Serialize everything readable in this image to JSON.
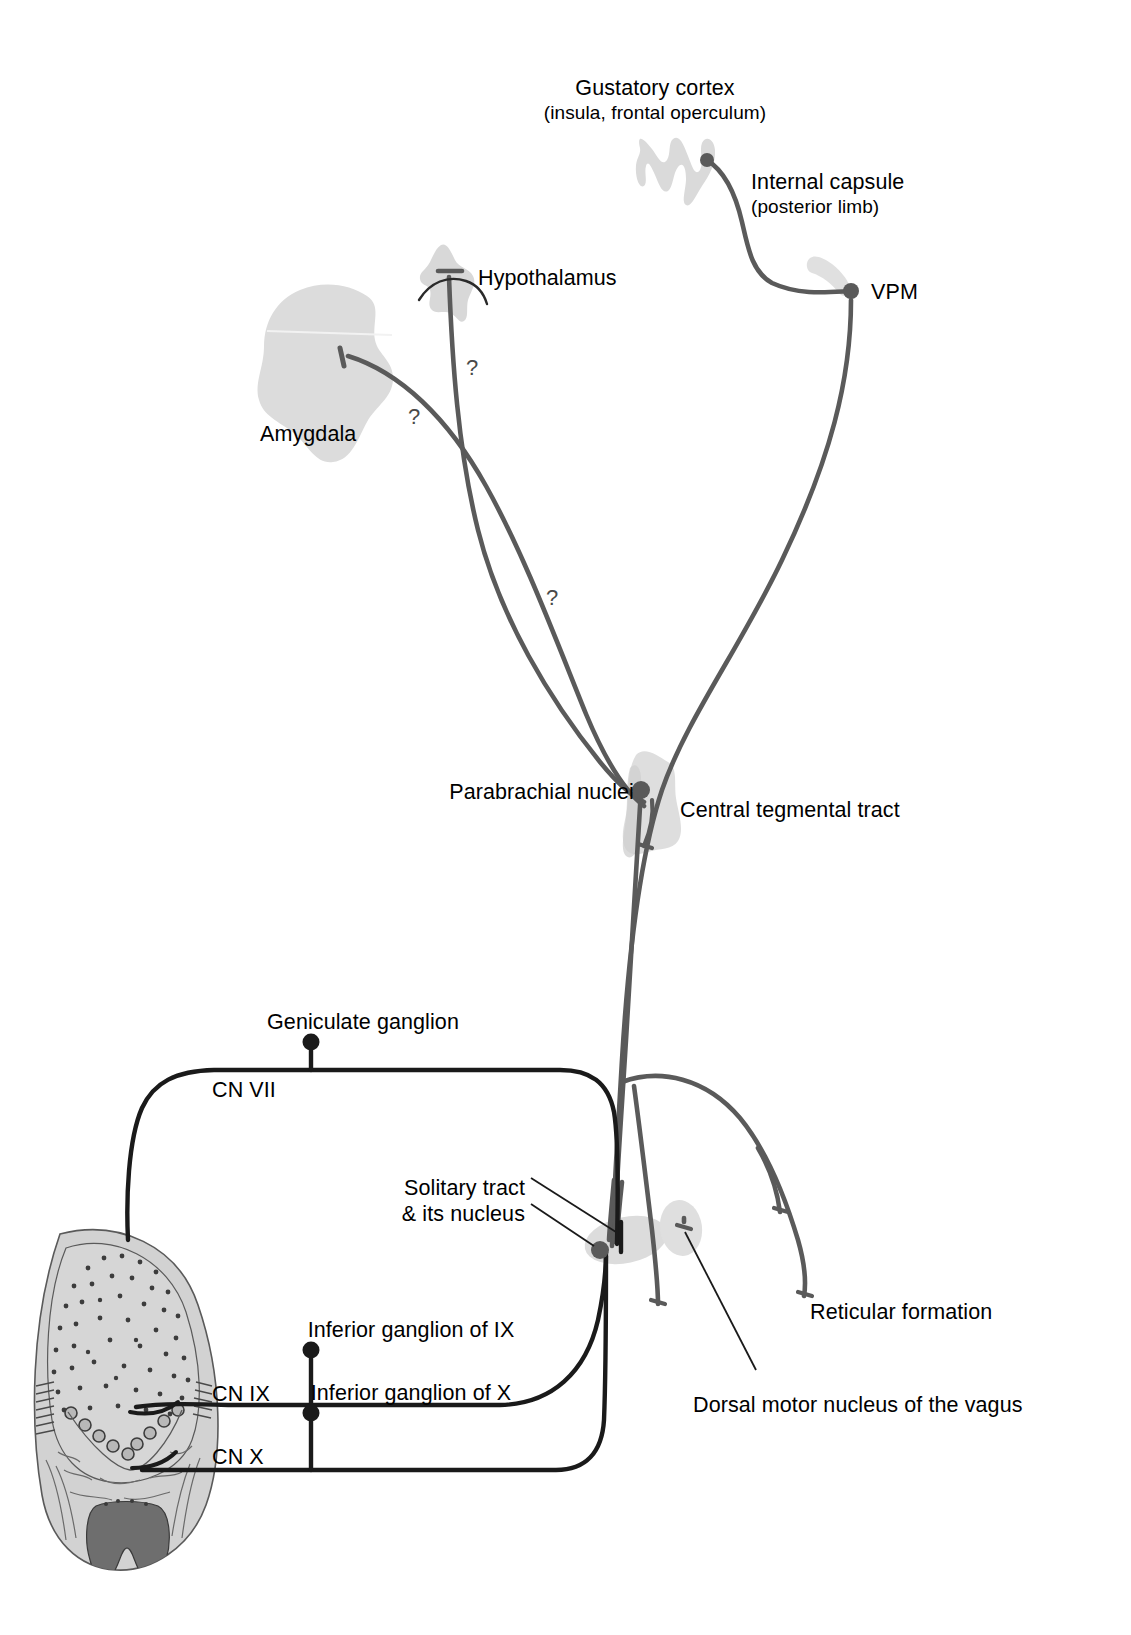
{
  "figure": {
    "palette": {
      "background": "#ffffff",
      "text": "#000000",
      "tract_gray": "#5a5a5a",
      "nerve_black": "#1a1a1a",
      "structure_fill": "#d9d9d9",
      "structure_fill_light": "#e2e2e2",
      "tongue_fill": "#cfcfcf",
      "tongue_outline": "#4a4a4a",
      "epiglottis_fill": "#6e6e6e",
      "leader_line": "#1a1a1a"
    }
  },
  "labels": {
    "gustatory_cortex": {
      "main": "Gustatory cortex",
      "sub": "(insula, frontal operculum)",
      "x": 655,
      "y": 76
    },
    "internal_capsule": {
      "main": "Internal capsule",
      "sub": "(posterior limb)",
      "x": 751,
      "y": 170
    },
    "vpm": {
      "main": "VPM",
      "x": 871,
      "y": 280
    },
    "hypothalamus": {
      "main": "Hypothalamus",
      "x": 478,
      "y": 266
    },
    "amygdala": {
      "main": "Amygdala",
      "x": 260,
      "y": 422
    },
    "parabrachial_nuclei": {
      "main": "Parabrachial nuclei",
      "x": 625,
      "y": 780
    },
    "central_tegmental_tract": {
      "main": "Central tegmental tract",
      "x": 680,
      "y": 798
    },
    "geniculate_ganglion": {
      "main": "Geniculate ganglion",
      "x": 277,
      "y": 1010
    },
    "cn_vii": {
      "main": "CN VII",
      "x": 212,
      "y": 1078
    },
    "solitary_tract": {
      "main": "Solitary tract",
      "x": 519,
      "y": 1176
    },
    "solitary_nucleus": {
      "main": "& its nucleus",
      "x": 519,
      "y": 1202
    },
    "inferior_ganglion_ix": {
      "main": "Inferior ganglion of IX",
      "x": 297,
      "y": 1318
    },
    "cn_ix": {
      "main": "CN IX",
      "x": 212,
      "y": 1382
    },
    "inferior_ganglion_x": {
      "main": "Inferior ganglion of X",
      "x": 297,
      "y": 1381
    },
    "cn_x": {
      "main": "CN X",
      "x": 212,
      "y": 1445
    },
    "reticular_formation": {
      "main": "Reticular formation",
      "x": 810,
      "y": 1300
    },
    "dorsal_motor_nucleus_vagus": {
      "main": "Dorsal motor nucleus of the vagus",
      "x": 693,
      "y": 1393
    }
  },
  "question_marks": [
    {
      "id": "q-hypothalamus",
      "text": "?",
      "x": 466,
      "y": 357
    },
    {
      "id": "q-amygdala",
      "text": "?",
      "x": 408,
      "y": 406
    },
    {
      "id": "q-ascending",
      "text": "?",
      "x": 546,
      "y": 587
    }
  ],
  "structures": [
    {
      "id": "gustatory-cortex-shape",
      "name": "gustatory cortex (insular/opercular cortex ribbon)"
    },
    {
      "id": "internal-capsule-shape",
      "name": "internal capsule posterior limb"
    },
    {
      "id": "hypothalamus-shape",
      "name": "hypothalamus"
    },
    {
      "id": "amygdala-shape",
      "name": "amygdala"
    },
    {
      "id": "parabrachial-shape",
      "name": "parabrachial nuclei / pons"
    },
    {
      "id": "solitary-nucleus-shape",
      "name": "solitary nucleus region of medulla"
    },
    {
      "id": "dorsal-motor-nucleus-shape",
      "name": "dorsal motor nucleus of vagus"
    },
    {
      "id": "tongue-shape",
      "name": "tongue with papillae and epiglottis"
    }
  ],
  "nodes": [
    {
      "id": "node-cortex",
      "name": "gustatory cortex terminal",
      "x": 707,
      "y": 160
    },
    {
      "id": "node-vpm",
      "name": "VPM terminal",
      "x": 851,
      "y": 291
    },
    {
      "id": "node-hypothalamus",
      "name": "hypothalamus terminal",
      "x": 449,
      "y": 273
    },
    {
      "id": "node-amygdala",
      "name": "amygdala terminal",
      "x": 344,
      "y": 355
    },
    {
      "id": "node-parabrachial",
      "name": "parabrachial nuclei terminal",
      "x": 641,
      "y": 790
    },
    {
      "id": "node-geniculate",
      "name": "geniculate ganglion",
      "x": 311,
      "y": 1045
    },
    {
      "id": "node-inferior-ix",
      "name": "inferior ganglion of IX",
      "x": 311,
      "y": 1353
    },
    {
      "id": "node-inferior-x",
      "name": "inferior ganglion of X",
      "x": 311,
      "y": 1416
    },
    {
      "id": "node-solitary",
      "name": "solitary nucleus terminal",
      "x": 600,
      "y": 1250
    }
  ],
  "pathways": [
    {
      "id": "path-thalamocortical",
      "name": "thalamocortical fibers (VPM to gustatory cortex via internal capsule)"
    },
    {
      "id": "path-central-tegmental",
      "name": "central tegmental tract (parabrachial / solitary to VPM)"
    },
    {
      "id": "path-solitary-to-parabrachial",
      "name": "solitary nucleus to parabrachial nuclei"
    },
    {
      "id": "path-parabrachial-to-hypothalamus",
      "name": "parabrachial to hypothalamus"
    },
    {
      "id": "path-parabrachial-to-amygdala",
      "name": "parabrachial to amygdala"
    },
    {
      "id": "path-cn7",
      "name": "CN VII facial nerve chorda tympani from anterior tongue"
    },
    {
      "id": "path-cn9",
      "name": "CN IX glossopharyngeal nerve from posterior tongue"
    },
    {
      "id": "path-cn10",
      "name": "CN X vagus nerve from epiglottis"
    },
    {
      "id": "path-reticular",
      "name": "projections to reticular formation"
    },
    {
      "id": "path-dorsal-motor",
      "name": "projection to dorsal motor nucleus of the vagus"
    }
  ]
}
